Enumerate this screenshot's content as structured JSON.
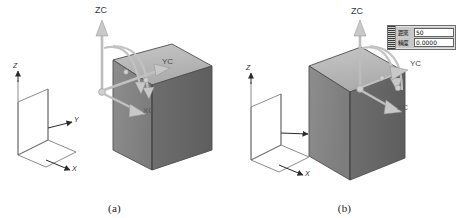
{
  "figure": {
    "type": "cad-technical-illustration",
    "panels": [
      {
        "id": "a",
        "caption": "(a)",
        "solid": {
          "name": "rectangular-block",
          "top_face_color": "#b9b9b9",
          "left_face_color": "#8e8e8e",
          "right_face_color": "#6f6f6f",
          "edge_color": "#4a4a4a"
        },
        "triad": {
          "name": "dynamic-wcs-triad",
          "labels": {
            "z": "ZC",
            "y": "YC",
            "x": "XC"
          },
          "handle_color": "#c9c9c9",
          "arc_color": "#bdbdbd"
        },
        "datum": {
          "name": "absolute-csys",
          "labels": {
            "z": "Z",
            "y": "Y",
            "x": "X"
          },
          "line_color": "#7a7a7a"
        }
      },
      {
        "id": "b",
        "caption": "(b)",
        "solid": {
          "name": "rectangular-block",
          "top_face_color": "#b9b9b9",
          "left_face_color": "#8e8e8e",
          "right_face_color": "#6f6f6f",
          "edge_color": "#4a4a4a"
        },
        "triad": {
          "name": "dynamic-wcs-triad",
          "labels": {
            "z": "ZC",
            "y": "YC",
            "x": "XC"
          },
          "handle_color": "#c9c9c9",
          "arc_color": "#bdbdbd"
        },
        "datum": {
          "name": "absolute-csys",
          "labels": {
            "z": "Z",
            "y": "Y",
            "x": "X"
          },
          "line_color": "#7a7a7a"
        },
        "dialog": {
          "name": "inline-value-entry",
          "fields": [
            {
              "label": "距离",
              "value": "50"
            },
            {
              "label": "精度",
              "value": "0.0000"
            }
          ],
          "background": "#c8c8c8",
          "border": "#6e6e6e",
          "field_background": "#fefefe"
        }
      }
    ]
  }
}
